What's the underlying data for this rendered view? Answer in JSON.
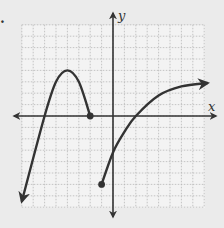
{
  "chart_data": {
    "type": "line",
    "title": "",
    "xlabel": "x",
    "ylabel": "y",
    "xlim": [
      -8,
      8
    ],
    "ylim": [
      -8,
      8
    ],
    "grid": true,
    "grid_step": 1,
    "tick_labels": false,
    "series": [
      {
        "name": "left-piece",
        "description": "Downward-opening curve, arrow at left end, closed dot at right end",
        "points": [
          [
            -8,
            -7.5
          ],
          [
            -6,
            0
          ],
          [
            -5,
            3
          ],
          [
            -4,
            4
          ],
          [
            -3,
            3
          ],
          [
            -2,
            0
          ]
        ],
        "start": {
          "x": -8,
          "y": -7.5,
          "marker": "arrow"
        },
        "end": {
          "x": -2,
          "y": 0,
          "marker": "closed-dot"
        },
        "vertex": {
          "x": -4,
          "y": 4
        }
      },
      {
        "name": "right-piece",
        "description": "Increasing concave-down curve, closed dot at left end, arrow at right end",
        "points": [
          [
            -1,
            -6
          ],
          [
            0,
            -3.2
          ],
          [
            1,
            -1.4
          ],
          [
            2,
            0
          ],
          [
            4,
            1.8
          ],
          [
            6,
            2.6
          ],
          [
            8.3,
            2.9
          ]
        ],
        "start": {
          "x": -1,
          "y": -6,
          "marker": "closed-dot"
        },
        "end": {
          "x": 8.3,
          "y": 2.9,
          "marker": "arrow"
        }
      }
    ]
  },
  "labels": {
    "x_axis": "x",
    "y_axis": "y",
    "problem_marker": "."
  },
  "colors": {
    "background": "#ebebeb",
    "grid_area": "#f3f3f3",
    "grid_line": "#b8b8b8",
    "curve": "#333333"
  }
}
